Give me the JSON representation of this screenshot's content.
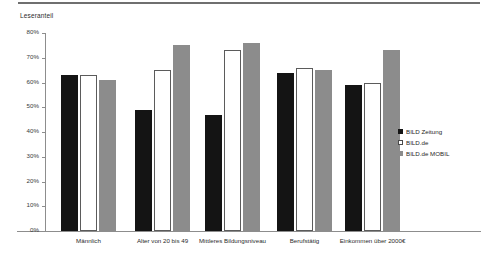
{
  "chart_data": {
    "type": "bar",
    "title": "",
    "ylabel": "Leseranteil",
    "xlabel": "",
    "ylim": [
      0,
      80
    ],
    "ytick_labels": [
      "80%",
      "70%",
      "60%",
      "50%",
      "40%",
      "30%",
      "20%",
      "10%",
      "0%"
    ],
    "ytick_values": [
      80,
      70,
      60,
      50,
      40,
      30,
      20,
      10,
      0
    ],
    "grid": false,
    "legend_position": "right",
    "categories": [
      "Männlich",
      "Alter von 20 bis 49",
      "Mittleres Bildungsniveau",
      "Berufstätig",
      "Einkommen über 2000€"
    ],
    "series": [
      {
        "name": "BILD Zeitung",
        "color": "#141414",
        "values": [
          63,
          49,
          47,
          64,
          59
        ]
      },
      {
        "name": "BILD.de",
        "color": "#ffffff",
        "values": [
          63,
          65,
          73,
          66,
          60
        ]
      },
      {
        "name": "BILD.de MOBIL",
        "color": "#8c8c8c",
        "values": [
          61,
          75,
          76,
          65,
          73
        ]
      }
    ]
  },
  "legend": {
    "items": [
      {
        "label": "BILD Zeitung"
      },
      {
        "label": "BILD.de"
      },
      {
        "label": "BILD.de MOBIL"
      }
    ]
  }
}
